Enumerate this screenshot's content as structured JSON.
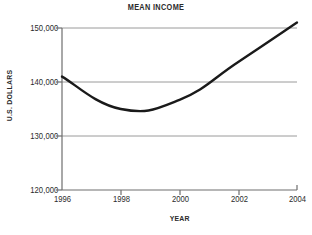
{
  "chart_data": {
    "type": "line",
    "title": "MEAN INCOME",
    "xlabel": "YEAR",
    "ylabel": "U.S. DOLLARS",
    "x": [
      1996,
      1998,
      2000,
      2002,
      2004
    ],
    "values": [
      141000,
      135000,
      136700,
      143700,
      151000
    ],
    "xticklabels": [
      "1996",
      "1998",
      "2000",
      "2002",
      "2004"
    ],
    "yticks": [
      120000,
      130000,
      140000,
      150000
    ],
    "yticklabels": [
      "120,000",
      "130,000",
      "140,000",
      "150,000"
    ],
    "xlim": [
      1996,
      2004
    ],
    "ylim": [
      120000,
      150000
    ],
    "grid": "horizontal",
    "legend": "none",
    "series": [
      {
        "name": "Mean Income",
        "values": [
          141000,
          135000,
          136700,
          143700,
          151000
        ],
        "color": "#1a1a1a",
        "line_width": 2.4,
        "smoothing": "slight"
      }
    ],
    "colors": {
      "background": "#ffffff",
      "axis": "#6e6e6e",
      "gridline": "#9a9a9a",
      "line": "#1a1a1a",
      "text": "#2b2b2b"
    }
  }
}
